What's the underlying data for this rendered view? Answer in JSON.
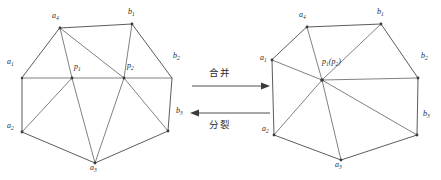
{
  "figure": {
    "background_color": "#ffffff",
    "line_color": "#4a4a4a",
    "text_color": "#2b2b2b"
  },
  "operations": {
    "merge_label": "合并",
    "split_label": "分裂"
  },
  "left_mesh": {
    "name": "two-vertex-triangulated-polygon",
    "labels": {
      "a1": "a",
      "a1_sub": "1",
      "a2": "a",
      "a2_sub": "2",
      "a3": "a",
      "a3_sub": "3",
      "a4": "a",
      "a4_sub": "4",
      "b1": "b",
      "b1_sub": "1",
      "b2": "b",
      "b2_sub": "2",
      "b3": "b",
      "b3_sub": "3",
      "p1": "p",
      "p1_sub": "1",
      "p2": "p",
      "p2_sub": "2"
    }
  },
  "right_mesh": {
    "name": "merged-single-vertex-polygon",
    "labels": {
      "a1": "a",
      "a1_sub": "1",
      "a2": "a",
      "a2_sub": "2",
      "a3": "a",
      "a3_sub": "3",
      "a4": "a",
      "a4_sub": "4",
      "b1": "b",
      "b1_sub": "1",
      "b2": "b",
      "b2_sub": "2",
      "b3": "b",
      "b3_sub": "3",
      "p_merged": "p",
      "p_merged_sub": "1",
      "p_merged_paren_open": "(p",
      "p_merged_paren_sub": "2",
      "p_merged_paren_close": ")"
    }
  }
}
